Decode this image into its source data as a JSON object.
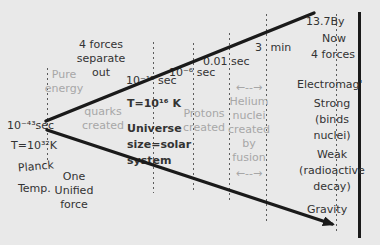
{
  "colors": {
    "background": "#e9e9e9",
    "ink": "#333333",
    "muted_text": "#a7a7a7",
    "line": "#1a1a1a"
  },
  "eras": {
    "planck": {
      "time": "10⁻⁴³sec",
      "temp": "T=10³²K",
      "name_line1": "Planck",
      "name_line2": "Temp.",
      "state": "Pure\nenergy",
      "force": "One\nUnified\nforce"
    },
    "separation": {
      "event": "4 forces\nseparate\nout",
      "created": "quarks\ncreated"
    },
    "quark": {
      "time": "10⁻¹² sec",
      "temp": "T=10¹⁶ K",
      "size": "Universe\nsize=solar\nsystem"
    },
    "proton": {
      "time": "10⁻⁶ sec",
      "created": "Protons\ncreated"
    },
    "helium": {
      "time": "0.01 sec",
      "span_arrow": "←--→",
      "created": "Helium\nnuclei\ncreated\nby\nfusion"
    },
    "three_minutes": {
      "time": "3 min"
    },
    "now": {
      "age": "13.7By",
      "label": "Now",
      "forces_heading": "4 forces",
      "forces": [
        "Electromag'",
        "Strong\n(binds\nnuclei)",
        "Weak\n(radioactive\ndecay)",
        "Gravity"
      ]
    }
  }
}
